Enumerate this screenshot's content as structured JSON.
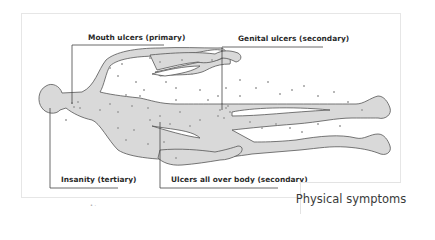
{
  "figure": {
    "colors": {
      "body_fill": "#d9d9d9",
      "body_stroke": "#555555",
      "dot": "#a0a0a0",
      "leader_line": "#444444",
      "frame_border": "#e6e6e6"
    }
  },
  "callouts": [
    {
      "label": "Mouth ulcers (primary)"
    },
    {
      "label": "Genital ulcers (secondary)"
    },
    {
      "label": "Insanity (tertiary)"
    },
    {
      "label": "Ulcers all over body (secondary)"
    }
  ],
  "caption": {
    "title": "Physical symptoms"
  },
  "footnote_mark": "• ·"
}
